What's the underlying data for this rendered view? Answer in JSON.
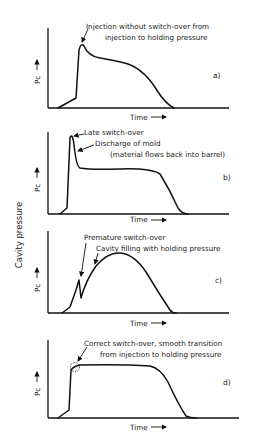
{
  "figure": {
    "y_axis_title": "Cavity pressure",
    "panels": [
      {
        "id": "a)",
        "ylabel": "Pc",
        "xlabel": "Time",
        "annotation_line1": "Injection without switch-over from",
        "annotation_line2": "injection to holding pressure"
      },
      {
        "id": "b)",
        "ylabel": "Pc",
        "xlabel": "Time",
        "annotation_1": "Late switch-over",
        "annotation_2_line1": "Discharge of mold",
        "annotation_2_line2": "(material flows back into barrel)"
      },
      {
        "id": "c)",
        "ylabel": "Pc",
        "xlabel": "Time",
        "annotation_1": "Premature switch-over",
        "annotation_2": "Cavity filling with holding pressure"
      },
      {
        "id": "d)",
        "ylabel": "Pc",
        "xlabel": "Time",
        "annotation_line1": "Correct switch-over, smooth transition",
        "annotation_line2": "from injection to holding pressure"
      }
    ]
  }
}
